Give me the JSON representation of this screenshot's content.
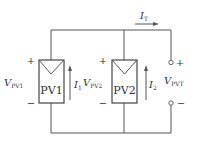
{
  "diagram": {
    "type": "circuit",
    "colors": {
      "line": "#555555",
      "text": "#333333",
      "background": "#ffffff"
    },
    "modules": [
      {
        "id": "pv1",
        "label": "PV1",
        "voltage_label": "V",
        "voltage_sub": "PV1",
        "current_label": "I",
        "current_sub": "1",
        "plus": "+",
        "minus": "−"
      },
      {
        "id": "pv2",
        "label": "PV2",
        "voltage_label": "V",
        "voltage_sub": "PV2",
        "current_label": "I",
        "current_sub": "2",
        "plus": "+",
        "minus": "−"
      }
    ],
    "output": {
      "voltage_label": "V",
      "voltage_sub": "PVT",
      "plus": "+",
      "minus": "−"
    },
    "total_current": {
      "label": "I",
      "sub": "T"
    }
  }
}
